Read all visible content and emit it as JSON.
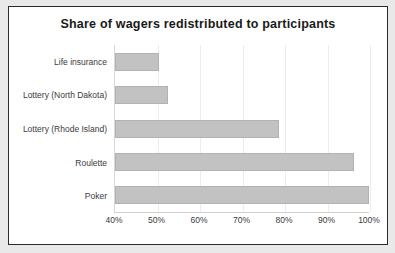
{
  "chart_data": {
    "type": "bar",
    "orientation": "horizontal",
    "title": "Share of wagers redistributed to participants",
    "xlabel": "",
    "ylabel": "",
    "xlim": [
      40,
      100
    ],
    "xtick_labels": [
      "40%",
      "50%",
      "60%",
      "70%",
      "80%",
      "90%",
      "100%"
    ],
    "xticks": [
      40,
      50,
      60,
      70,
      80,
      90,
      100
    ],
    "grid": true,
    "legend": false,
    "categories": [
      "Life insurance",
      "Lottery (North Dakota)",
      "Lottery (Rhode Island)",
      "Roulette",
      "Poker"
    ],
    "values": [
      50.4,
      52.5,
      78.6,
      96.2,
      100.0
    ],
    "value_labels": [
      "50%",
      "53%",
      "79%",
      "96%",
      "100%"
    ],
    "bar_color": "#c2c2c2",
    "bar_border_color": "#b2b2b2",
    "gridline_color": "#ececec",
    "frame_border_color": "#2b2b2b",
    "background_color": "#ffffff",
    "page_background_color": "#e9e9e9"
  }
}
